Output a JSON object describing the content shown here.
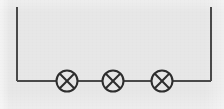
{
  "figure": {
    "kind": "circuit-diagram",
    "width": 224,
    "height": 109,
    "background_color": "#e7e7e7",
    "line_color": "#4a4a4a",
    "line_width": 2
  },
  "circuit": {
    "topology": "series",
    "open_terminals": 2,
    "wire": {
      "left_terminal_x": 17,
      "left_terminal_top_y": 7,
      "right_terminal_x": 211,
      "right_terminal_top_y": 7,
      "rail_y": 81
    },
    "components": [
      {
        "symbol": "lamp",
        "label": "lamp-1",
        "cx": 67,
        "cy": 81,
        "r": 11
      },
      {
        "symbol": "lamp",
        "label": "lamp-2",
        "cx": 113,
        "cy": 81,
        "r": 11
      },
      {
        "symbol": "lamp",
        "label": "lamp-3",
        "cx": 162,
        "cy": 81,
        "r": 11
      }
    ],
    "segments": [
      {
        "name": "left-lead",
        "x1": 17,
        "y1": 7,
        "x2": 17,
        "y2": 81
      },
      {
        "name": "left-to-lamp1",
        "x1": 17,
        "y1": 81,
        "x2": 56,
        "y2": 81
      },
      {
        "name": "lamp1-to-lamp2",
        "x1": 78,
        "y1": 81,
        "x2": 102,
        "y2": 81
      },
      {
        "name": "lamp2-to-lamp3",
        "x1": 124,
        "y1": 81,
        "x2": 151,
        "y2": 81
      },
      {
        "name": "lamp3-to-right",
        "x1": 173,
        "y1": 81,
        "x2": 211,
        "y2": 81
      },
      {
        "name": "right-lead",
        "x1": 211,
        "y1": 81,
        "x2": 211,
        "y2": 7
      }
    ]
  }
}
